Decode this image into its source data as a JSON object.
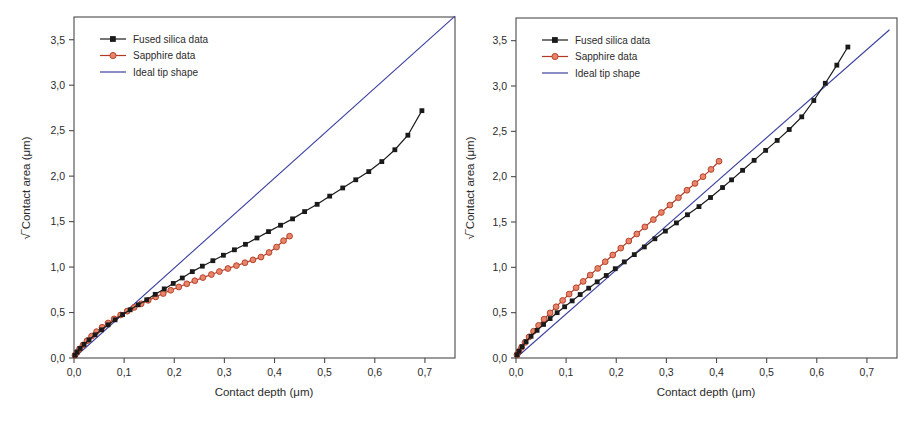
{
  "figure": {
    "background": "#ffffff",
    "panel_count": 2
  },
  "colors": {
    "fused_silica": "#1a1a1a",
    "sapphire_fill": "#e8846a",
    "sapphire_edge": "#b03a22",
    "ideal_tip": "#3b3fa0",
    "axis": "#4a4a4a",
    "text": "#2b2b2b"
  },
  "axes": {
    "xlabel": "Contact depth (μm)",
    "ylabel": "√‾Contact area (μm)",
    "xlim": [
      0.0,
      0.76
    ],
    "ylim": [
      0.0,
      3.75
    ],
    "xticks": [
      0.0,
      0.1,
      0.2,
      0.3,
      0.4,
      0.5,
      0.6,
      0.7
    ],
    "yticks": [
      0.0,
      0.5,
      1.0,
      1.5,
      2.0,
      2.5,
      3.0,
      3.5
    ],
    "xtick_labels": [
      "0,0",
      "0,1",
      "0,2",
      "0,3",
      "0,4",
      "0,5",
      "0,6",
      "0,7"
    ],
    "ytick_labels": [
      "0,0",
      "0,5",
      "1,0",
      "1,5",
      "2,0",
      "2,5",
      "3,0",
      "3,5"
    ],
    "grid": false
  },
  "legend": {
    "position": "top-left",
    "entries": [
      {
        "label": "Fused silica data",
        "marker": "square",
        "color": "#1a1a1a"
      },
      {
        "label": "Sapphire data",
        "marker": "circle",
        "color": "#e8846a"
      },
      {
        "label": "Ideal tip shape",
        "marker": "line",
        "color": "#3b3fa0"
      }
    ]
  },
  "chart_data": [
    {
      "type": "scatter",
      "panel": "left",
      "title": "",
      "xlabel": "Contact depth (μm)",
      "ylabel": "√‾Contact area (μm)",
      "xlim": [
        0.0,
        0.76
      ],
      "ylim": [
        0.0,
        3.75
      ],
      "grid": false,
      "legend_position": "top-left",
      "series": [
        {
          "name": "Fused silica data",
          "marker": "square",
          "color": "#1a1a1a",
          "x": [
            0.002,
            0.006,
            0.012,
            0.02,
            0.03,
            0.042,
            0.055,
            0.068,
            0.082,
            0.097,
            0.112,
            0.128,
            0.145,
            0.162,
            0.18,
            0.198,
            0.216,
            0.236,
            0.256,
            0.277,
            0.298,
            0.32,
            0.342,
            0.365,
            0.388,
            0.412,
            0.436,
            0.46,
            0.485,
            0.51,
            0.536,
            0.562,
            0.588,
            0.614,
            0.64,
            0.666,
            0.694
          ],
          "y": [
            0.03,
            0.065,
            0.105,
            0.15,
            0.2,
            0.255,
            0.31,
            0.365,
            0.42,
            0.478,
            0.53,
            0.585,
            0.64,
            0.7,
            0.76,
            0.82,
            0.88,
            0.95,
            1.01,
            1.07,
            1.13,
            1.19,
            1.25,
            1.32,
            1.39,
            1.46,
            1.53,
            1.61,
            1.69,
            1.78,
            1.87,
            1.96,
            2.05,
            2.16,
            2.29,
            2.45,
            2.72
          ]
        },
        {
          "name": "Sapphire data",
          "marker": "circle",
          "color": "#e8846a",
          "x": [
            0.002,
            0.006,
            0.011,
            0.018,
            0.026,
            0.035,
            0.045,
            0.056,
            0.068,
            0.08,
            0.093,
            0.106,
            0.12,
            0.134,
            0.148,
            0.163,
            0.178,
            0.193,
            0.209,
            0.225,
            0.241,
            0.257,
            0.274,
            0.29,
            0.307,
            0.324,
            0.341,
            0.357,
            0.373,
            0.389,
            0.404,
            0.418,
            0.43
          ],
          "y": [
            0.03,
            0.062,
            0.1,
            0.143,
            0.19,
            0.24,
            0.29,
            0.338,
            0.385,
            0.43,
            0.473,
            0.515,
            0.556,
            0.596,
            0.634,
            0.672,
            0.709,
            0.745,
            0.781,
            0.816,
            0.85,
            0.884,
            0.918,
            0.951,
            0.984,
            1.016,
            1.048,
            1.079,
            1.11,
            1.16,
            1.22,
            1.29,
            1.34
          ]
        },
        {
          "name": "Ideal tip shape",
          "marker": "line",
          "color": "#3b3fa0",
          "x": [
            0.0,
            0.76
          ],
          "y": [
            0.0,
            3.76
          ]
        }
      ]
    },
    {
      "type": "scatter",
      "panel": "right",
      "title": "",
      "xlabel": "Contact depth (μm)",
      "ylabel": "√‾Contact area (μm)",
      "xlim": [
        0.0,
        0.76
      ],
      "ylim": [
        0.0,
        3.75
      ],
      "grid": false,
      "legend_position": "top-left",
      "series": [
        {
          "name": "Fused silica data",
          "marker": "square",
          "color": "#1a1a1a",
          "x": [
            0.002,
            0.006,
            0.012,
            0.02,
            0.03,
            0.042,
            0.055,
            0.068,
            0.082,
            0.097,
            0.112,
            0.128,
            0.145,
            0.162,
            0.18,
            0.198,
            0.216,
            0.236,
            0.256,
            0.277,
            0.298,
            0.32,
            0.342,
            0.365,
            0.388,
            0.412,
            0.43,
            0.452,
            0.475,
            0.498,
            0.521,
            0.545,
            0.57,
            0.594,
            0.617,
            0.64,
            0.662
          ],
          "y": [
            0.035,
            0.075,
            0.125,
            0.18,
            0.24,
            0.305,
            0.37,
            0.435,
            0.5,
            0.565,
            0.63,
            0.7,
            0.77,
            0.84,
            0.91,
            0.985,
            1.06,
            1.14,
            1.225,
            1.315,
            1.4,
            1.49,
            1.58,
            1.67,
            1.77,
            1.88,
            1.965,
            2.07,
            2.18,
            2.29,
            2.4,
            2.52,
            2.66,
            2.84,
            3.03,
            3.23,
            3.43
          ]
        },
        {
          "name": "Sapphire data",
          "marker": "circle",
          "color": "#e8846a",
          "x": [
            0.002,
            0.006,
            0.011,
            0.018,
            0.026,
            0.035,
            0.045,
            0.056,
            0.068,
            0.08,
            0.093,
            0.106,
            0.12,
            0.134,
            0.148,
            0.163,
            0.178,
            0.193,
            0.209,
            0.225,
            0.241,
            0.257,
            0.274,
            0.29,
            0.307,
            0.324,
            0.341,
            0.357,
            0.373,
            0.389,
            0.405
          ],
          "y": [
            0.035,
            0.072,
            0.118,
            0.172,
            0.232,
            0.295,
            0.36,
            0.428,
            0.497,
            0.565,
            0.635,
            0.705,
            0.775,
            0.845,
            0.915,
            0.988,
            1.062,
            1.136,
            1.212,
            1.29,
            1.368,
            1.446,
            1.527,
            1.605,
            1.687,
            1.768,
            1.85,
            1.925,
            2.0,
            2.08,
            2.17
          ]
        },
        {
          "name": "Ideal tip shape",
          "marker": "line",
          "color": "#3b3fa0",
          "x": [
            0.0,
            0.745
          ],
          "y": [
            0.0,
            3.62
          ]
        }
      ]
    }
  ]
}
